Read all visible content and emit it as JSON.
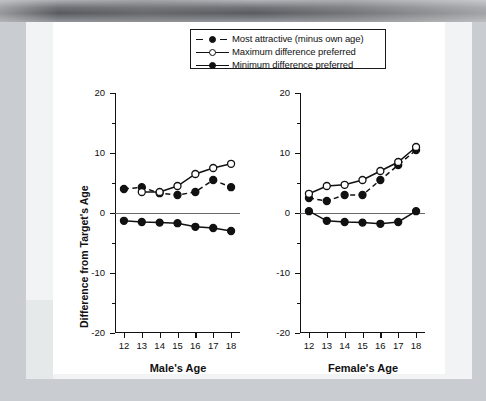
{
  "legend": {
    "items": [
      {
        "label": "Most attractive (minus own age)",
        "style": "dashed-filled"
      },
      {
        "label": "Maximum difference preferred",
        "style": "solid-open"
      },
      {
        "label": "Minimum difference preferred",
        "style": "solid-filled"
      }
    ]
  },
  "axes": {
    "y_title": "Difference from Target's Age",
    "y_ticks": [
      "20",
      "10",
      "0",
      "-10",
      "-20"
    ],
    "x_ticks": [
      "12",
      "13",
      "14",
      "15",
      "16",
      "17",
      "18"
    ],
    "left_x_title": "Male's Age",
    "right_x_title": "Female's Age"
  },
  "colors": {
    "ink": "#111111",
    "zero_line": "#6a6a6a",
    "paper": "#ffffff",
    "page": "#f2f3f4",
    "backdrop": "#c9ccd1"
  },
  "chart_data": [
    {
      "type": "line",
      "title": "Male's Age",
      "xlabel": "Male's Age",
      "ylabel": "Difference from Target's Age",
      "x": [
        12,
        13,
        14,
        15,
        16,
        17,
        18
      ],
      "xlim": [
        11.5,
        18.5
      ],
      "ylim": [
        -20,
        20
      ],
      "grid": false,
      "legend_position": "top-center-shared",
      "series": [
        {
          "name": "Most attractive (minus own age)",
          "marker": "filled-circle",
          "line": "dashed",
          "x": [
            12,
            13,
            14,
            15,
            16,
            17,
            18
          ],
          "values": [
            4.0,
            4.3,
            3.3,
            3.0,
            3.5,
            5.5,
            4.3
          ]
        },
        {
          "name": "Maximum difference preferred",
          "marker": "open-circle",
          "line": "solid",
          "x": [
            13,
            14,
            15,
            16,
            17,
            18
          ],
          "values": [
            3.5,
            3.5,
            4.5,
            6.5,
            7.5,
            8.2
          ]
        },
        {
          "name": "Minimum difference preferred",
          "marker": "filled-circle",
          "line": "solid",
          "x": [
            12,
            13,
            14,
            15,
            16,
            17,
            18
          ],
          "values": [
            -1.3,
            -1.5,
            -1.6,
            -1.7,
            -2.3,
            -2.5,
            -3.0
          ]
        }
      ]
    },
    {
      "type": "line",
      "title": "Female's Age",
      "xlabel": "Female's Age",
      "ylabel": "Difference from Target's Age",
      "x": [
        12,
        13,
        14,
        15,
        16,
        17,
        18
      ],
      "xlim": [
        11.5,
        18.5
      ],
      "ylim": [
        -20,
        20
      ],
      "grid": false,
      "legend_position": "top-center-shared",
      "series": [
        {
          "name": "Most attractive (minus own age)",
          "marker": "filled-circle",
          "line": "dashed",
          "x": [
            12,
            13,
            14,
            15,
            16,
            17,
            18
          ],
          "values": [
            2.5,
            2.0,
            3.0,
            3.0,
            5.5,
            8.0,
            10.5
          ]
        },
        {
          "name": "Maximum difference preferred",
          "marker": "open-circle",
          "line": "solid",
          "x": [
            12,
            13,
            14,
            15,
            16,
            17,
            18
          ],
          "values": [
            3.2,
            4.5,
            4.7,
            5.5,
            7.0,
            8.5,
            11.0
          ]
        },
        {
          "name": "Minimum difference preferred",
          "marker": "filled-circle",
          "line": "solid",
          "x": [
            12,
            13,
            14,
            15,
            16,
            17,
            18
          ],
          "values": [
            0.3,
            -1.3,
            -1.5,
            -1.6,
            -1.8,
            -1.5,
            0.3
          ]
        }
      ]
    }
  ]
}
